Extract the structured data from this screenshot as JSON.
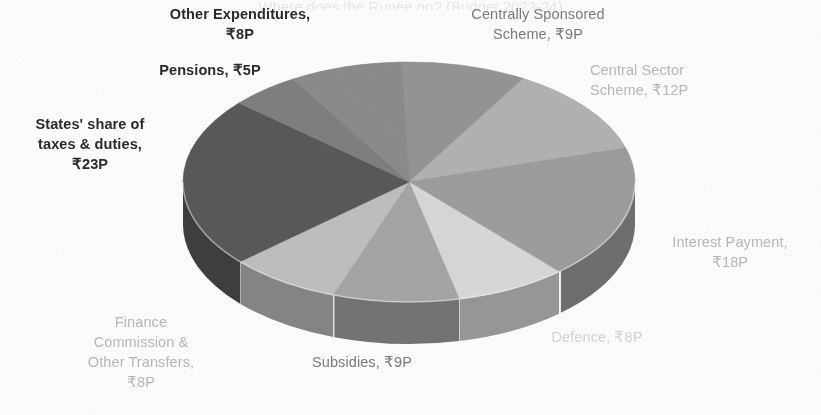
{
  "title_clipped": "Where does the Rupee go? (Budget 2023-24)",
  "colors": {
    "states_share": "#595959",
    "pensions": "#808080",
    "other_expenditures": "#8c8c8c",
    "centrally_sponsored": "#959595",
    "central_sector": "#b3b3b3",
    "interest_payment": "#9e9e9e",
    "defence": "#d9d9d9",
    "subsidies": "#a6a6a6",
    "finance_commission": "#bfbfbf",
    "background": "#ffffff",
    "label_dark": "#2b2b2b",
    "label_mid": "#7c7c7c",
    "label_light": "#b9b9b9"
  },
  "labels": {
    "other_expenditures": "Other Expenditures,\n₹8P",
    "pensions": "Pensions, ₹5P",
    "states_share": "States' share of\ntaxes & duties,\n₹23P",
    "centrally_sponsored": "Centrally Sponsored\nScheme, ₹9P",
    "central_sector": "Central Sector\nScheme, ₹12P",
    "interest_payment": "Interest Payment,\n₹18P",
    "defence": "Defence, ₹8P",
    "subsidies": "Subsidies, ₹9P",
    "finance_commission": "Finance\nCommission &\nOther Transfers,\n₹8P"
  },
  "chart_data": {
    "type": "pie",
    "title": "Where does the Rupee go? (Budget 2023-24)",
    "unit": "paise per rupee",
    "value_prefix": "₹",
    "value_suffix": "P",
    "three_d": true,
    "legend": "none (direct data labels)",
    "total": 100,
    "categories": [
      "States' share of taxes & duties",
      "Interest Payment",
      "Central Sector Scheme",
      "Centrally Sponsored Scheme",
      "Subsidies",
      "Defence",
      "Finance Commission & Other Transfers",
      "Other Expenditures",
      "Pensions"
    ],
    "values": [
      23,
      18,
      12,
      9,
      9,
      8,
      8,
      8,
      5
    ],
    "value_labels": [
      "₹23P",
      "₹18P",
      "₹12P",
      "₹9P",
      "₹9P",
      "₹8P",
      "₹8P",
      "₹8P",
      "₹5P"
    ],
    "slices": [
      {
        "name": "Centrally Sponsored Scheme",
        "value": 9,
        "label": "₹9P",
        "color": "#959595"
      },
      {
        "name": "Central Sector Scheme",
        "value": 12,
        "label": "₹12P",
        "color": "#b3b3b3"
      },
      {
        "name": "Interest Payment",
        "value": 18,
        "label": "₹18P",
        "color": "#9e9e9e"
      },
      {
        "name": "Defence",
        "value": 8,
        "label": "₹8P",
        "color": "#d9d9d9"
      },
      {
        "name": "Subsidies",
        "value": 9,
        "label": "₹9P",
        "color": "#a6a6a6"
      },
      {
        "name": "Finance Commission & Other Transfers",
        "value": 8,
        "label": "₹8P",
        "color": "#bfbfbf"
      },
      {
        "name": "States' share of taxes & duties",
        "value": 23,
        "label": "₹23P",
        "color": "#595959"
      },
      {
        "name": "Pensions",
        "value": 5,
        "label": "₹5P",
        "color": "#808080"
      },
      {
        "name": "Other Expenditures",
        "value": 8,
        "label": "₹8P",
        "color": "#8c8c8c"
      }
    ]
  }
}
